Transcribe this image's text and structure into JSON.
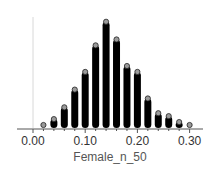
{
  "chart_data": {
    "type": "dotplot",
    "title": "",
    "xlabel": "Female_n_50",
    "ylabel": "",
    "x": [
      0.02,
      0.04,
      0.06,
      0.08,
      0.1,
      0.12,
      0.14,
      0.16,
      0.18,
      0.2,
      0.22,
      0.24,
      0.26,
      0.28,
      0.3
    ],
    "values": [
      1,
      3,
      7,
      13,
      19,
      28,
      36,
      30,
      21,
      19,
      10,
      5,
      4,
      2,
      1
    ],
    "xlim": [
      -0.01,
      0.31
    ],
    "xticks": [
      0.0,
      0.1,
      0.2,
      0.3
    ],
    "xtick_labels": [
      "0.00",
      "0.10",
      "0.20",
      "0.30"
    ],
    "grid": false,
    "legend": null,
    "colors": {
      "dot_fill": "#000000",
      "top_dot": "#9a9a9a",
      "axis": "#555555",
      "y_line": "#d0d0d0"
    }
  }
}
